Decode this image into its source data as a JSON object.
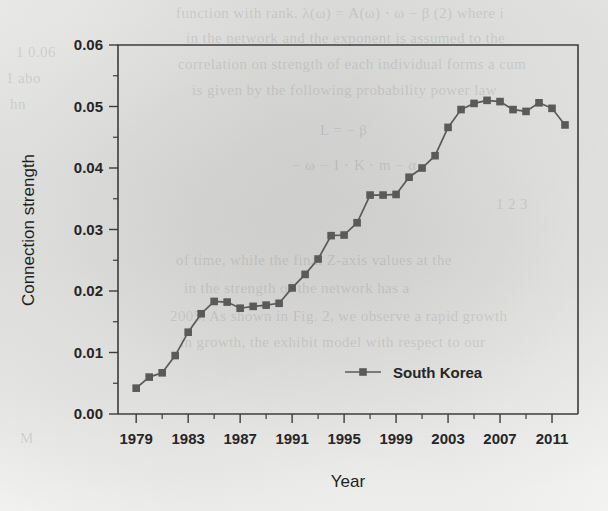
{
  "chart_data": {
    "type": "line",
    "title": "",
    "xlabel": "Year",
    "ylabel": "Connection strength",
    "xlim": [
      1977.6,
      1013.0
    ],
    "ylim": [
      0.0,
      0.06
    ],
    "grid": false,
    "legend_position": "inside-bottom-center",
    "x_tick_labels": [
      "1979",
      "1983",
      "1987",
      "1991",
      "1995",
      "1999",
      "2003",
      "2007",
      "2011"
    ],
    "x_tick_values": [
      1979,
      1983,
      1987,
      1991,
      1995,
      1999,
      2003,
      2007,
      2011
    ],
    "x_minor_tick_values": [
      1981,
      1985,
      1989,
      1993,
      1997,
      2001,
      2005,
      2009
    ],
    "y_tick_labels": [
      "0.00",
      "0.01",
      "0.02",
      "0.03",
      "0.04",
      "0.05",
      "0.06"
    ],
    "y_tick_values": [
      0.0,
      0.01,
      0.02,
      0.03,
      0.04,
      0.05,
      0.06
    ],
    "y_minor_tick_values": [
      0.005,
      0.015,
      0.025,
      0.035,
      0.045,
      0.055
    ],
    "series": [
      {
        "name": "South Korea",
        "color": "#5a5a5a",
        "marker": "square",
        "x": [
          1979,
          1980,
          1981,
          1982,
          1983,
          1984,
          1985,
          1986,
          1987,
          1988,
          1989,
          1990,
          1991,
          1992,
          1993,
          1994,
          1995,
          1996,
          1997,
          1998,
          1999,
          2000,
          2001,
          2002,
          2003,
          2004,
          2005,
          2006,
          2007,
          2008,
          2009,
          2010,
          2011,
          2012
        ],
        "values": [
          0.0042,
          0.006,
          0.0067,
          0.0095,
          0.0133,
          0.0163,
          0.0183,
          0.0182,
          0.0172,
          0.0175,
          0.0177,
          0.018,
          0.0205,
          0.0227,
          0.0252,
          0.029,
          0.0291,
          0.0311,
          0.0356,
          0.0356,
          0.0357,
          0.0385,
          0.04,
          0.042,
          0.0466,
          0.0495,
          0.0505,
          0.051,
          0.0508,
          0.0495,
          0.0492,
          0.0506,
          0.0497,
          0.047
        ]
      }
    ]
  },
  "legend": {
    "entries": [
      {
        "label": "South Korea"
      }
    ]
  },
  "page_background": {
    "ghost_lines": [
      {
        "text": "function with rank. λ(ω) = A(ω) ⋅ ω − β (2) where i",
        "x": 176,
        "y": 4
      },
      {
        "text": "in the network and the exponent is assumed to the",
        "x": 186,
        "y": 30
      },
      {
        "text": "correlation on strength of each individual forms a cum",
        "x": 178,
        "y": 56
      },
      {
        "text": "is given by the following probability power law",
        "x": 192,
        "y": 82
      },
      {
        "text": "L = − β",
        "x": 320,
        "y": 122
      },
      {
        "text": "− ω − 1 ⋅ K ⋅ m − α",
        "x": 292,
        "y": 156
      },
      {
        "text": "of time, while the final Z-axis values at the",
        "x": 176,
        "y": 252
      },
      {
        "text": "in the strength of the network has a",
        "x": 184,
        "y": 280
      },
      {
        "text": "2005. As shown in Fig. 2, we observe a rapid growth",
        "x": 170,
        "y": 308
      },
      {
        "text": "in growth, the exhibit model with respect to our",
        "x": 180,
        "y": 334
      },
      {
        "text": "1 0.06",
        "x": 16,
        "y": 44
      },
      {
        "text": "1 abo",
        "x": 6,
        "y": 70
      },
      {
        "text": "hn",
        "x": 10,
        "y": 96
      },
      {
        "text": "1 2 3",
        "x": 496,
        "y": 196
      },
      {
        "text": "M",
        "x": 20,
        "y": 430
      }
    ]
  }
}
